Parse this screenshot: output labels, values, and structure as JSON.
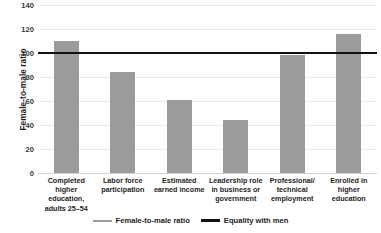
{
  "chart_data": {
    "type": "bar",
    "title": "",
    "xlabel": "",
    "ylabel": "Female-to-male ratio",
    "ylim": [
      0,
      140
    ],
    "yticks": [
      0,
      20,
      40,
      60,
      80,
      100,
      120,
      140
    ],
    "grid": true,
    "legend_position": "bottom",
    "categories": [
      "Completed higher education, adults 25–54",
      "Labor force participation",
      "Estimated earned income",
      "Leadership role in business or government",
      "Professional/ technical employment",
      "Enrolled in higher education"
    ],
    "category_lines": [
      [
        "Completed higher",
        "education,",
        "adults 25–54"
      ],
      [
        "Labor force",
        "participation"
      ],
      [
        "Estimated",
        "earned income"
      ],
      [
        "Leadership role",
        "in business or",
        "government"
      ],
      [
        "Professional/",
        "technical",
        "employment"
      ],
      [
        "Enrolled in",
        "higher",
        "education"
      ]
    ],
    "series": [
      {
        "name": "Female-to-male ratio",
        "type": "bar",
        "color": "#9b9b9b",
        "values": [
          110,
          84,
          61,
          44,
          98,
          116
        ]
      },
      {
        "name": "Equality with men",
        "type": "reference-line",
        "color": "#111111",
        "value": 100
      }
    ]
  },
  "legend": {
    "items": [
      {
        "label": "Female-to-male ratio",
        "swatch": "series"
      },
      {
        "label": "Equality with men",
        "swatch": "equality"
      }
    ]
  }
}
